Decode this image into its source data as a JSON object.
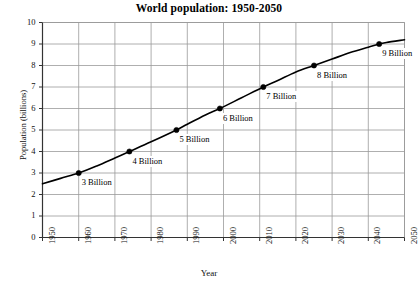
{
  "chart_data": {
    "type": "line",
    "title": "World population: 1950-2050",
    "xlabel": "Year",
    "ylabel": "Population (billions)",
    "xlim": [
      1950,
      2050
    ],
    "ylim": [
      0,
      10
    ],
    "grid": true,
    "legend": null,
    "x_ticks": [
      1950,
      1960,
      1970,
      1980,
      1990,
      2000,
      2010,
      2020,
      2030,
      2040,
      2050
    ],
    "y_ticks": [
      0,
      1,
      2,
      3,
      4,
      5,
      6,
      7,
      8,
      9,
      10
    ],
    "series": [
      {
        "name": "World population",
        "x": [
          1950,
          1955,
          1960,
          1965,
          1970,
          1974,
          1980,
          1987,
          1990,
          1995,
          1999,
          2005,
          2011,
          2015,
          2020,
          2025,
          2030,
          2035,
          2040,
          2043,
          2045,
          2050
        ],
        "values": [
          2.5,
          2.75,
          3.0,
          3.33,
          3.7,
          4.0,
          4.45,
          5.0,
          5.27,
          5.7,
          6.0,
          6.5,
          7.0,
          7.3,
          7.7,
          8.0,
          8.3,
          8.6,
          8.85,
          9.0,
          9.07,
          9.2
        ]
      }
    ],
    "markers": [
      {
        "label": "3 Billion",
        "x": 1960,
        "y": 3
      },
      {
        "label": "4 Billion",
        "x": 1974,
        "y": 4
      },
      {
        "label": "5 Billion",
        "x": 1987,
        "y": 5
      },
      {
        "label": "6 Billion",
        "x": 1999,
        "y": 6
      },
      {
        "label": "7 Billion",
        "x": 2011,
        "y": 7
      },
      {
        "label": "8 Billion",
        "x": 2025,
        "y": 8
      },
      {
        "label": "9 Billion",
        "x": 2043,
        "y": 9
      }
    ],
    "colors": {
      "line": "#000000",
      "marker": "#000000",
      "grid": "#9a9a9a",
      "axis": "#333333",
      "background": "#ffffff",
      "text": "#111111"
    }
  }
}
